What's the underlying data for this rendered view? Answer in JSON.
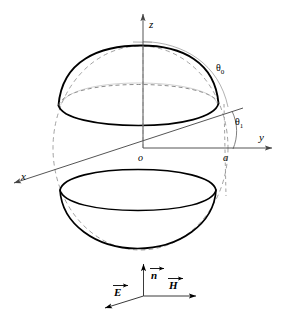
{
  "figure": {
    "type": "geometry-diagram",
    "colors": {
      "stroke": "#000000",
      "thin_stroke": "#555555",
      "dashed_stroke": "#777777",
      "background": "#ffffff"
    },
    "axes": [
      {
        "name": "z-axis",
        "label": "z",
        "direction": "up"
      },
      {
        "name": "y-axis",
        "label": "y",
        "direction": "right"
      },
      {
        "name": "x-axis",
        "label": "x",
        "direction": "lower-left"
      }
    ],
    "origin_label": "o",
    "point_labels": [
      {
        "name": "radius-point-a",
        "label": "a"
      }
    ],
    "angles": [
      {
        "name": "theta-0",
        "symbol": "θ",
        "subscript": "0"
      },
      {
        "name": "theta-1",
        "symbol": "θ",
        "subscript": "1"
      }
    ],
    "vectors": [
      {
        "name": "n-vector",
        "label": "n",
        "direction": "up"
      },
      {
        "name": "H-vector",
        "label": "H",
        "direction": "right"
      },
      {
        "name": "E-vector",
        "label": "E",
        "direction": "lower-left"
      }
    ]
  }
}
